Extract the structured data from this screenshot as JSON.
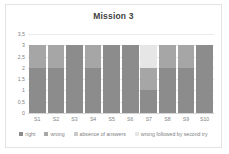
{
  "chart_data": {
    "type": "bar",
    "title": "Mission 3",
    "xlabel": "",
    "ylabel": "",
    "ylim": [
      0,
      3.5
    ],
    "grid": true,
    "legend_position": "bottom",
    "stacked": true,
    "categories": [
      "S1",
      "S2",
      "S3",
      "S4",
      "S5",
      "S6",
      "S7",
      "S8",
      "S9",
      "S10"
    ],
    "yticks": [
      "0",
      "0,5",
      "1",
      "1,5",
      "2",
      "2,5",
      "3",
      "3,5"
    ],
    "ytick_values": [
      0,
      0.5,
      1,
      1.5,
      2,
      2.5,
      3,
      3.5
    ],
    "series": [
      {
        "name": "right",
        "color": "#8c8c8c",
        "values": [
          2,
          2,
          3,
          2,
          3,
          3,
          1,
          2,
          2,
          3
        ]
      },
      {
        "name": "wrong",
        "color": "#a6a6a6",
        "values": [
          1,
          1,
          0,
          1,
          0,
          0,
          1,
          1,
          1,
          0
        ]
      },
      {
        "name": "absence of answers",
        "color": "#c9c9c9",
        "values": [
          0,
          0,
          0,
          0,
          0,
          0,
          0,
          0,
          0,
          0
        ]
      },
      {
        "name": "wrong followed by second try",
        "color": "#e6e6e6",
        "values": [
          0,
          0,
          0,
          0,
          0,
          0,
          1,
          0,
          0,
          0
        ]
      }
    ]
  }
}
